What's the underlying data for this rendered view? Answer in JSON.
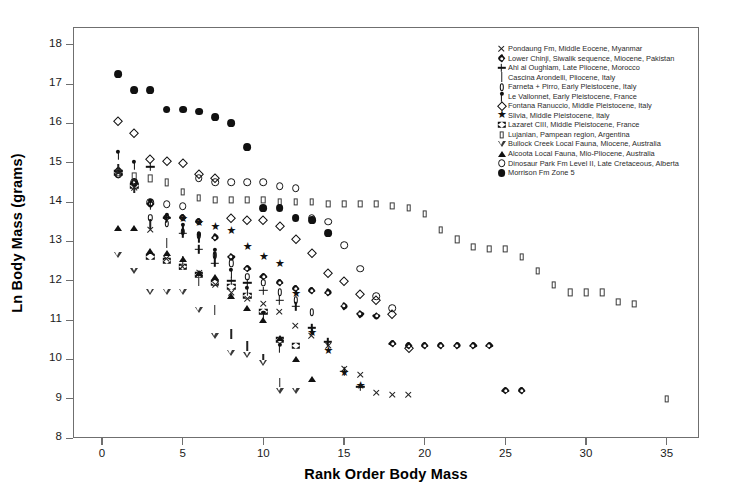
{
  "chart_data": {
    "type": "scatter",
    "title": "",
    "xlabel": "Rank Order Body Mass",
    "ylabel": "Ln Body Mass (grams)",
    "xlim": [
      -1.8,
      37.0
    ],
    "ylim": [
      8,
      18.45
    ],
    "xticks": [
      0,
      5,
      10,
      15,
      20,
      25,
      30,
      35
    ],
    "yticks": [
      8,
      9,
      10,
      11,
      12,
      13,
      14,
      15,
      16,
      17,
      18
    ],
    "grid": false,
    "legend_position": "top-right-inside",
    "series": [
      {
        "name": "Pondaung Fm, Middle Eocene, Myanmar",
        "marker": "x",
        "marker_key": "k-ex",
        "x": [
          1,
          2,
          3,
          4,
          5,
          6,
          7,
          8,
          9,
          10,
          11,
          12,
          13,
          14,
          15,
          16,
          17,
          18,
          19
        ],
        "y": [
          14.75,
          14.35,
          13.3,
          12.55,
          12.35,
          12.2,
          11.9,
          11.7,
          11.55,
          11.4,
          11.2,
          10.85,
          10.6,
          10.35,
          9.75,
          9.6,
          9.15,
          9.1,
          9.1
        ]
      },
      {
        "name": "Lower Chinji, Siwalik sequence, Miocene, Pakistan",
        "marker": "flower",
        "marker_key": "k-flower",
        "x": [
          1,
          2,
          3,
          4,
          5,
          6,
          7,
          8,
          9,
          10,
          11,
          12,
          13,
          14,
          15,
          16,
          17,
          18,
          19,
          20,
          21,
          22,
          23,
          24,
          25,
          26
        ],
        "y": [
          14.8,
          14.5,
          13.95,
          13.6,
          13.6,
          13.5,
          13.1,
          12.6,
          12.3,
          12.1,
          11.95,
          11.8,
          11.75,
          11.7,
          11.35,
          11.15,
          11.1,
          10.4,
          10.35,
          10.35,
          10.35,
          10.35,
          10.35,
          10.35,
          9.2,
          9.2
        ]
      },
      {
        "name": "Ahl al Oughlam, Late Pliocene, Morocco",
        "marker": "+",
        "marker_key": "k-plus",
        "x": [
          3,
          4,
          5,
          6,
          7,
          8,
          9,
          10,
          11,
          12,
          13,
          14,
          15,
          16
        ],
        "y": [
          14.9,
          13.6,
          13.2,
          12.8,
          12.45,
          12.0,
          11.95,
          11.75,
          11.5,
          11.35,
          10.8,
          10.45,
          9.7,
          9.3
        ]
      },
      {
        "name": "Cascina Arondelli, Pliocene, Italy",
        "marker": "|",
        "marker_key": "k-bar",
        "x": [
          1,
          2,
          3,
          4,
          5,
          6,
          7,
          8,
          9,
          10,
          11
        ],
        "y": [
          14.85,
          14.35,
          13.45,
          12.95,
          12.5,
          12.0,
          11.25,
          10.65,
          10.35,
          10.0,
          9.4
        ]
      },
      {
        "name": "Farneta + Pirro, Early Pleistocene, Italy",
        "marker": "0",
        "marker_key": "k-zero",
        "x": [
          1,
          2,
          3,
          4,
          5,
          6,
          7,
          8,
          9,
          10,
          11,
          12,
          13
        ],
        "y": [
          14.7,
          14.5,
          13.6,
          13.45,
          13.25,
          13.15,
          12.65,
          12.45,
          12.1,
          11.95,
          11.7,
          11.5,
          11.2
        ]
      },
      {
        "name": "Le Vallonnet, Early Pleistocene, France",
        "marker": "lollipop",
        "marker_key": "k-lolli",
        "x": [
          1,
          2,
          3,
          4,
          5,
          6,
          7,
          8,
          9,
          10,
          11
        ],
        "y": [
          15.2,
          14.95,
          13.95,
          13.6,
          13.35,
          13.1,
          12.7,
          12.2,
          11.75,
          11.1,
          10.3
        ]
      },
      {
        "name": "Fontana Ranuccio, Middle Pleistocene, Italy",
        "marker": "diamond",
        "marker_key": "k-diamond",
        "x": [
          1,
          2,
          3,
          4,
          5,
          6,
          7,
          8,
          9,
          10,
          11,
          12,
          13,
          14,
          15,
          16,
          17,
          18,
          19
        ],
        "y": [
          16.05,
          15.75,
          15.1,
          15.05,
          15.0,
          14.7,
          14.6,
          13.6,
          13.55,
          13.55,
          13.4,
          13.05,
          12.7,
          12.2,
          12.0,
          11.65,
          11.5,
          11.15,
          10.3
        ]
      },
      {
        "name": "Slivia, Middle Pleistocene, Italy",
        "marker": "star",
        "marker_key": "k-star",
        "x": [
          5,
          6,
          7,
          8,
          9,
          10,
          11,
          12,
          13,
          14,
          15,
          16
        ],
        "y": [
          13.55,
          13.45,
          13.35,
          13.25,
          12.85,
          12.6,
          12.4,
          11.65,
          10.65,
          10.2,
          9.65,
          9.3
        ]
      },
      {
        "name": "Lazaret CIII, Middle Pleistocene, France",
        "marker": "bowtie",
        "marker_key": "k-bowtie",
        "x": [
          1,
          2,
          3,
          4,
          5,
          6,
          7,
          8,
          9,
          10,
          11,
          12
        ],
        "y": [
          14.75,
          14.4,
          12.6,
          12.5,
          12.35,
          12.15,
          11.95,
          11.85,
          11.6,
          11.2,
          10.5,
          10.35
        ]
      },
      {
        "name": "Lujanian, Pampean region, Argentina",
        "marker": "square",
        "marker_key": "k-square",
        "x": [
          1,
          2,
          3,
          4,
          5,
          6,
          7,
          8,
          9,
          10,
          11,
          12,
          13,
          14,
          15,
          16,
          17,
          18,
          19,
          20,
          21,
          22,
          23,
          24,
          25,
          26,
          27,
          28,
          29,
          30,
          31,
          32,
          33,
          35
        ],
        "y": [
          14.75,
          14.65,
          14.6,
          14.5,
          14.25,
          14.1,
          14.05,
          14.05,
          14.05,
          14.05,
          14.0,
          14.0,
          14.0,
          13.95,
          13.95,
          13.95,
          13.95,
          13.9,
          13.85,
          13.7,
          13.3,
          13.05,
          12.85,
          12.8,
          12.8,
          12.6,
          12.25,
          11.9,
          11.7,
          11.7,
          11.7,
          11.45,
          11.4,
          9.0
        ]
      },
      {
        "name": "Bullock Creek Local Fauna, Miocene, Australia",
        "marker": "triangle-down",
        "marker_key": "k-tri-down",
        "x": [
          1,
          2,
          3,
          4,
          5,
          6,
          7,
          8,
          9,
          10,
          11,
          12
        ],
        "y": [
          12.65,
          12.25,
          11.7,
          11.7,
          11.7,
          11.25,
          10.6,
          10.15,
          10.1,
          9.9,
          9.2,
          9.2
        ]
      },
      {
        "name": "Alcoota Local Fauna, Mio-Pliocene, Australia",
        "marker": "triangle-up",
        "marker_key": "k-tri-up",
        "x": [
          1,
          2,
          3,
          4,
          5,
          6,
          7,
          8,
          9,
          10,
          11,
          12,
          13
        ],
        "y": [
          13.35,
          13.35,
          12.75,
          12.7,
          12.55,
          12.2,
          12.1,
          11.6,
          11.3,
          11.0,
          10.55,
          10.0,
          9.5
        ]
      },
      {
        "name": "Dinosaur Park Fm Level II, Late Cretaceous, Alberta",
        "marker": "circle-open",
        "marker_key": "k-circle-o",
        "x": [
          1,
          2,
          3,
          4,
          5,
          6,
          7,
          8,
          9,
          10,
          11,
          12,
          13,
          14,
          15,
          16,
          17,
          18
        ],
        "y": [
          14.7,
          14.5,
          14.0,
          13.95,
          13.9,
          14.6,
          14.5,
          14.5,
          14.5,
          14.5,
          14.4,
          14.35,
          13.6,
          13.5,
          12.9,
          12.3,
          11.6,
          11.3
        ]
      },
      {
        "name": "Morrison Fm Zone 5",
        "marker": "circle-filled",
        "marker_key": "k-circle-f",
        "x": [
          1,
          2,
          3,
          4,
          5,
          6,
          7,
          8,
          9,
          10,
          11,
          12,
          13,
          14
        ],
        "y": [
          17.25,
          16.85,
          16.85,
          16.35,
          16.35,
          16.3,
          16.15,
          16.0,
          15.4,
          13.85,
          13.85,
          13.6,
          13.55,
          13.2
        ]
      }
    ]
  }
}
